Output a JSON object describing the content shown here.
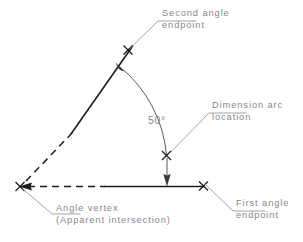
{
  "diagram": {
    "angle_value_label": "50°",
    "annotations": [
      {
        "id": "second-angle-endpoint",
        "line1": "Second angle",
        "line2": "endpoint"
      },
      {
        "id": "dimension-arc-location",
        "line1": "Dimension arc",
        "line2": "location"
      },
      {
        "id": "first-angle-endpoint",
        "line1": "First angle",
        "line2": "endpoint"
      },
      {
        "id": "angle-vertex",
        "line1": "Angle vertex",
        "line2": "(Apparent intersection)"
      }
    ],
    "colors": {
      "geometry": "#1c1c1c",
      "dimension": "#4a4a4a",
      "leader": "#9a9a9a",
      "text": "#878787",
      "background": "#ffffff"
    },
    "markers": {
      "vertex_label": "angle-vertex-marker",
      "first_endpoint_label": "first-angle-endpoint-marker",
      "second_endpoint_label": "second-angle-endpoint-marker",
      "arc_location_label": "dimension-arc-location-marker"
    }
  }
}
